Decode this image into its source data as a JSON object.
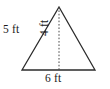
{
  "figure": {
    "kind": "triangle-with-altitude",
    "colors": {
      "stroke": "#2b2b2b",
      "altitude_stroke": "#4a4a4a",
      "background": "#ffffff",
      "text": "#1a1a1a"
    },
    "geometry": {
      "apex": [
        59,
        7
      ],
      "left_vertex": [
        22,
        70
      ],
      "right_vertex": [
        95,
        70
      ],
      "altitude_foot": [
        59,
        70
      ]
    },
    "labels": {
      "left_side": "5 ft",
      "height": "4 ft",
      "base": "6 ft"
    }
  }
}
